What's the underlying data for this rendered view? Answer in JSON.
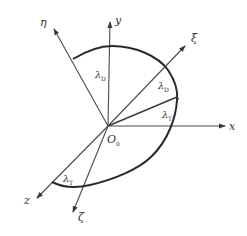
{
  "diagram": {
    "type": "coordinate-frame-rotation",
    "origin": {
      "label": "O",
      "subscript": "0"
    },
    "axes": [
      {
        "id": "x",
        "label": "x"
      },
      {
        "id": "y",
        "label": "y"
      },
      {
        "id": "z",
        "label": "z"
      },
      {
        "id": "xi",
        "label": "ξ"
      },
      {
        "id": "eta",
        "label": "η"
      },
      {
        "id": "zeta",
        "label": "ζ"
      }
    ],
    "angles": [
      {
        "id": "lambda-y-eta",
        "symbol": "λ",
        "subscript": "D",
        "between": [
          "y",
          "η"
        ]
      },
      {
        "id": "lambda-xi",
        "symbol": "λ",
        "subscript": "D",
        "between": [
          "ξ",
          "inner-line"
        ]
      },
      {
        "id": "lambda-x",
        "symbol": "λ",
        "subscript": "T",
        "between": [
          "inner-line",
          "x"
        ]
      },
      {
        "id": "lambda-z-zeta",
        "symbol": "λ",
        "subscript": "T",
        "between": [
          "z",
          "ζ"
        ]
      }
    ],
    "colors": {
      "line": "#2a2a2a",
      "text": "#333333",
      "background": "#ffffff"
    }
  }
}
